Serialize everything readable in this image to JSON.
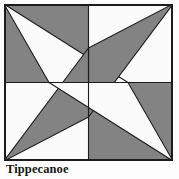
{
  "caption": {
    "title": "Tippecanoe"
  },
  "block": {
    "name": "Tippecanoe",
    "pattern_type": "quilt-block",
    "grid": "2x2 quadrants with rotational pinwheel star",
    "colors": {
      "shaded": "#838383",
      "background": "#fbfbfb",
      "outline": "#1c1c1c",
      "frame": "#1c1c1c",
      "page_background": "#fdfdfd"
    },
    "frame": {
      "x": 0,
      "y": 0,
      "width": 169,
      "height": 157,
      "stroke_width": 2
    },
    "grid_lines": [
      {
        "name": "vertical-center",
        "x1": 84.5,
        "y1": 0,
        "x2": 84.5,
        "y2": 157
      },
      {
        "name": "horizontal-center",
        "x1": 0,
        "y1": 78.5,
        "x2": 169,
        "y2": 78.5
      }
    ],
    "nodes": [
      {
        "name": "node-top",
        "x": 84.5,
        "y": 44
      },
      {
        "name": "node-left",
        "x": 45,
        "y": 78.5
      },
      {
        "name": "node-right",
        "x": 124,
        "y": 78.5
      },
      {
        "name": "node-bottom",
        "x": 84.5,
        "y": 113
      },
      {
        "name": "center",
        "x": 84.5,
        "y": 78.5
      }
    ],
    "shapes": [
      {
        "name": "q1-background-fill",
        "quadrant": "top-left",
        "fill": "shaded",
        "points": "0,0 84.5,0 84.5,78.5 0,78.5"
      },
      {
        "name": "q1-light-triangle",
        "quadrant": "top-left",
        "fill": "background",
        "points": "0,0 124,78.5 45,78.5"
      },
      {
        "name": "q2-background-fill",
        "quadrant": "top-right",
        "fill": "background",
        "points": "84.5,0 169,0 169,78.5 84.5,78.5"
      },
      {
        "name": "q2-shaded-triangle",
        "quadrant": "top-right",
        "fill": "shaded",
        "points": "169,0 84.5,113 84.5,44"
      },
      {
        "name": "q3-background-fill",
        "quadrant": "bottom-left",
        "fill": "background",
        "points": "0,78.5 84.5,78.5 84.5,157 0,157"
      },
      {
        "name": "q3-shaded-triangle",
        "quadrant": "bottom-left",
        "fill": "shaded",
        "points": "0,157 84.5,44 84.5,113"
      },
      {
        "name": "q4-background-fill",
        "quadrant": "bottom-right",
        "fill": "shaded",
        "points": "84.5,78.5 169,78.5 169,157 84.5,157"
      },
      {
        "name": "q4-light-triangle",
        "quadrant": "bottom-right",
        "fill": "background",
        "points": "169,157 45,78.5 124,78.5"
      }
    ],
    "outlines": [
      {
        "name": "edge-tl-to-right-node",
        "x1": 0,
        "y1": 0,
        "x2": 124,
        "y2": 78.5
      },
      {
        "name": "edge-tl-to-left-node",
        "x1": 0,
        "y1": 0,
        "x2": 45,
        "y2": 78.5
      },
      {
        "name": "edge-tr-to-bottom-node",
        "x1": 169,
        "y1": 0,
        "x2": 84.5,
        "y2": 113
      },
      {
        "name": "edge-tr-to-top-node",
        "x1": 169,
        "y1": 0,
        "x2": 84.5,
        "y2": 44
      },
      {
        "name": "edge-bl-to-top-node",
        "x1": 0,
        "y1": 157,
        "x2": 84.5,
        "y2": 44
      },
      {
        "name": "edge-bl-to-bottom-node",
        "x1": 0,
        "y1": 157,
        "x2": 84.5,
        "y2": 113
      },
      {
        "name": "edge-br-to-left-node",
        "x1": 169,
        "y1": 157,
        "x2": 45,
        "y2": 78.5
      },
      {
        "name": "edge-br-to-right-node",
        "x1": 169,
        "y1": 157,
        "x2": 124,
        "y2": 78.5
      }
    ]
  }
}
